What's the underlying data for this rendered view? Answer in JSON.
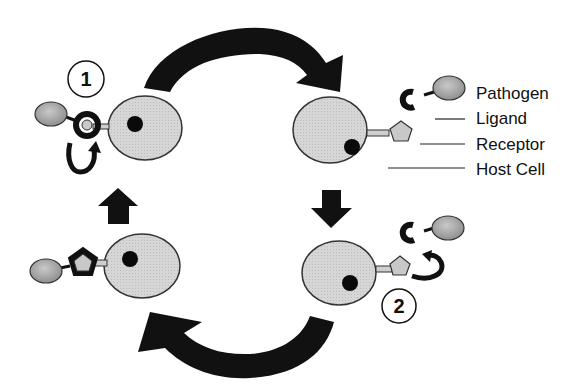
{
  "diagram": {
    "type": "cycle",
    "legend": {
      "pathogen": "Pathogen",
      "ligand": "Ligand",
      "receptor": "Receptor",
      "host_cell": "Host Cell"
    },
    "steps": [
      {
        "id": "step-1",
        "label": "1"
      },
      {
        "id": "step-2",
        "label": "2"
      }
    ],
    "colors": {
      "arrow": "#111111",
      "cell_fill": "#d4d4d4",
      "pathogen_fill": "#a8a8a8",
      "nucleus": "#0a0a0a",
      "receptor_fill": "#c8c8c8",
      "ligand": "#141414"
    }
  }
}
